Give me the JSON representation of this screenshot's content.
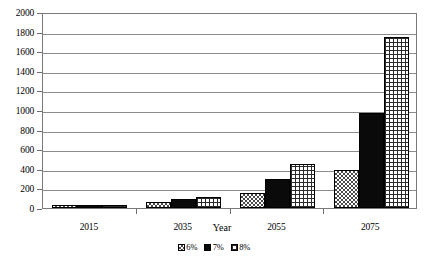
{
  "chart_data": {
    "type": "bar",
    "title": "",
    "subtitle": "",
    "xlabel": "Year",
    "ylabel": "",
    "categories": [
      "2015",
      "2035",
      "2055",
      "2075"
    ],
    "series": [
      {
        "name": "6%",
        "values": [
          30,
          60,
          150,
          390
        ],
        "pattern": "checkerboard"
      },
      {
        "name": "7%",
        "values": [
          35,
          95,
          300,
          970
        ],
        "pattern": "solid-black"
      },
      {
        "name": "8%",
        "values": [
          35,
          115,
          450,
          1740
        ],
        "pattern": "grid"
      }
    ],
    "ylim": [
      0,
      2000
    ],
    "y_ticks": [
      0,
      200,
      400,
      600,
      800,
      1000,
      1200,
      1400,
      1600,
      1800,
      2000
    ],
    "y_tick_labels": [
      "0",
      "200",
      "400",
      "600",
      "800",
      "1000",
      "1200",
      "1400",
      "1600",
      "1800",
      "2000"
    ],
    "grid": true,
    "grid_axis": "y",
    "legend_position": "bottom",
    "legend_entries": [
      "6%",
      "7%",
      "8%"
    ],
    "plot_background": "#ffffff",
    "frame_color": "#7a7a7a",
    "gridline_color": "#8c8c8c",
    "bar_outline_color": "#000000"
  }
}
